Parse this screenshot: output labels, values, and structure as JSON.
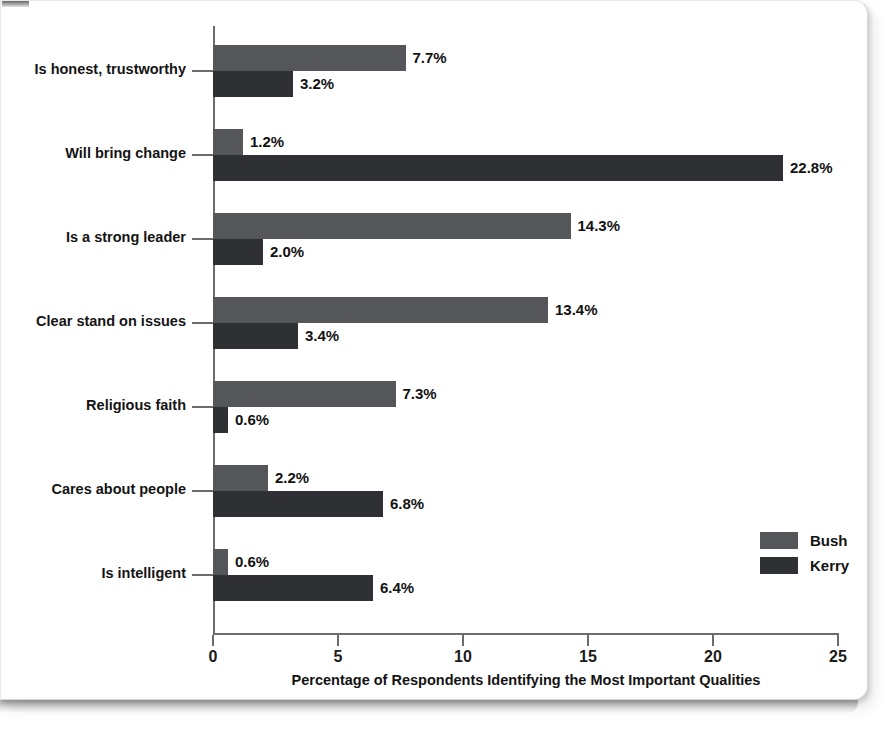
{
  "chart_data": {
    "type": "bar",
    "orientation": "horizontal",
    "grouped": true,
    "title": "",
    "xlabel": "Percentage of Respondents Identifying the Most Important Qualities",
    "ylabel": "",
    "xlim": [
      0,
      25
    ],
    "xticks": [
      0,
      5,
      10,
      15,
      20,
      25
    ],
    "xtick_labels": [
      "0",
      "5",
      "10",
      "15",
      "20",
      "25"
    ],
    "grid": false,
    "legend_position": "right-inside",
    "categories": [
      "Is honest, trustworthy",
      "Will bring change",
      "Is a strong leader",
      "Clear stand on issues",
      "Religious faith",
      "Cares about people",
      "Is intelligent"
    ],
    "series": [
      {
        "name": "Bush",
        "color": "#55565a",
        "values": [
          7.7,
          1.2,
          14.3,
          13.4,
          7.3,
          2.2,
          0.6
        ],
        "value_labels": [
          "7.7%",
          "1.2%",
          "14.3%",
          "13.4%",
          "7.3%",
          "2.2%",
          "0.6%"
        ]
      },
      {
        "name": "Kerry",
        "color": "#2f3033",
        "values": [
          3.2,
          22.8,
          2.0,
          3.4,
          0.6,
          6.8,
          6.4
        ],
        "value_labels": [
          "3.2%",
          "22.8%",
          "2.0%",
          "3.4%",
          "0.6%",
          "6.8%",
          "6.4%"
        ]
      }
    ]
  },
  "legend": {
    "items": [
      {
        "label": "Bush"
      },
      {
        "label": "Kerry"
      }
    ]
  }
}
